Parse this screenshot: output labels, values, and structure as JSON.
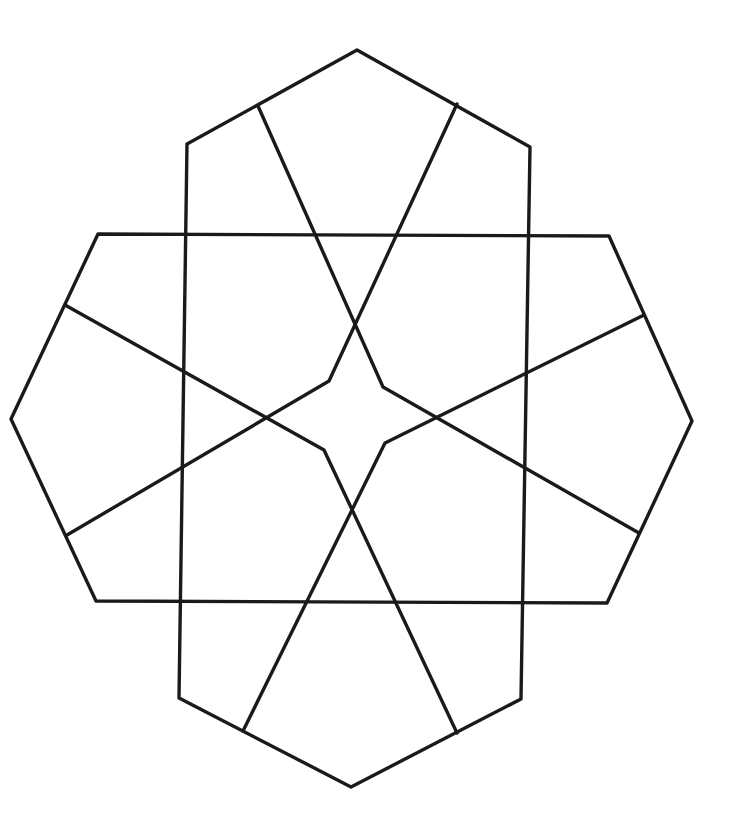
{
  "diagram": {
    "title": "",
    "stroke_color": "#1a1a1a",
    "background": "#ffffff",
    "stroke_width": 3.4,
    "shapes": [
      {
        "name": "vertical-hexagon",
        "points": [
          [
            357,
            50
          ],
          [
            530,
            147
          ],
          [
            521,
            699
          ],
          [
            351,
            787
          ],
          [
            179,
            698
          ],
          [
            187,
            144
          ]
        ]
      },
      {
        "name": "horizontal-hexagon",
        "points": [
          [
            98,
            234
          ],
          [
            609,
            236
          ],
          [
            692,
            421
          ],
          [
            607,
            603
          ],
          [
            96,
            601
          ],
          [
            11,
            419
          ]
        ]
      }
    ],
    "star_lines": [
      {
        "name": "star-arm-top-left-to-inner",
        "points": [
          [
            258,
            106
          ],
          [
            383,
            387
          ],
          [
            639,
            533
          ]
        ]
      },
      {
        "name": "star-arm-top-right-to-inner",
        "points": [
          [
            457,
            104
          ],
          [
            329,
            381
          ],
          [
            67,
            535
          ]
        ]
      },
      {
        "name": "star-arm-left-to-inner",
        "points": [
          [
            65,
            305
          ],
          [
            324,
            450
          ],
          [
            457,
            733
          ]
        ]
      },
      {
        "name": "star-arm-right-to-inner",
        "points": [
          [
            644,
            315
          ],
          [
            385,
            443
          ],
          [
            243,
            731
          ]
        ]
      }
    ]
  }
}
